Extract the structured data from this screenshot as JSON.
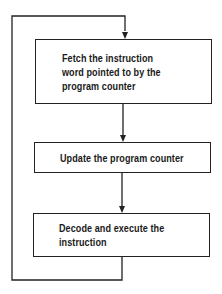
{
  "diagram": {
    "type": "flowchart",
    "title": "",
    "steps": [
      {
        "id": "fetch",
        "label": "Fetch the instruction\nword pointed to by the\nprogram counter"
      },
      {
        "id": "update",
        "label": "Update the program counter"
      },
      {
        "id": "decode",
        "label": "Decode and execute the\ninstruction"
      }
    ],
    "edges": [
      {
        "from": "fetch",
        "to": "update",
        "type": "arrow"
      },
      {
        "from": "update",
        "to": "decode",
        "type": "arrow"
      },
      {
        "from": "decode",
        "to": "fetch",
        "type": "loop-back-arrow"
      }
    ],
    "colors": {
      "line": "#222222",
      "text": "#1a1a1a",
      "background": "#ffffff"
    }
  }
}
